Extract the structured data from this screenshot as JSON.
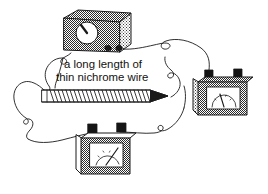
{
  "figure": {
    "background_color": "#ffffff",
    "line_color": "#1a1a1a",
    "shading_color": "#8c8c8c",
    "width": 268,
    "height": 194
  },
  "annotation": {
    "line1": "a long length of",
    "line2": "thin nichrome wire",
    "leader_label": "leader-line-to-coil"
  },
  "components": {
    "power_supply": {
      "name": "power-supply",
      "dial_label": "control-dial",
      "terminal_count": 2
    },
    "meter_right": {
      "name": "meter-right",
      "face_label": "meter-scale",
      "terminal_count": 2
    },
    "meter_bottom": {
      "name": "meter-bottom",
      "face_label": "meter-scale",
      "terminal_count": 2
    },
    "coil": {
      "name": "nichrome-wire-coil",
      "support_label": "pointed-rod"
    }
  },
  "wires": {
    "count": 4,
    "style": "free-hanging-leads-with-loops"
  }
}
